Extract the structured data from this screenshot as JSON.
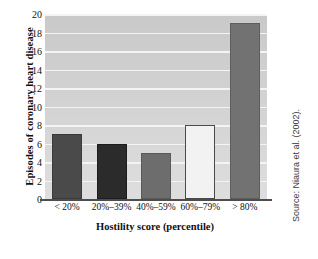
{
  "chart_data": {
    "type": "bar",
    "title": "",
    "categories": [
      "< 20%",
      "20%–39%",
      "40%–59%",
      "60%–79%",
      "> 80%"
    ],
    "values": [
      7,
      6,
      5,
      8,
      19
    ],
    "xlabel": "Hostility score (percentile)",
    "ylabel": "Episodes of coronary heart disease",
    "ylim": [
      0,
      20
    ],
    "ytick_labels": [
      "0",
      "2",
      "4",
      "6",
      "8",
      "10",
      "12",
      "14",
      "16",
      "18",
      "20"
    ],
    "ytick_values": [
      0,
      2,
      4,
      6,
      8,
      10,
      12,
      14,
      16,
      18,
      20
    ],
    "grid": true,
    "legend": "none",
    "bar_colors": [
      "#4a4a4a",
      "#2b2b2b",
      "#6d6d6d",
      "#f2f2f2",
      "#727272"
    ],
    "bar_edge_colors": [
      "#3a3a3a",
      "#1c1c1c",
      "#5a5a5a",
      "#4a4a4a",
      "#5e5e5e"
    ],
    "plot_background": "#d4d4d4",
    "gridline_color": "#f4f4f4",
    "axis_color": "#4d4d4d",
    "annotations": [
      "Source: Niaura et al. (2002)."
    ]
  },
  "source_note": "Source: Niaura et al. (2002)."
}
